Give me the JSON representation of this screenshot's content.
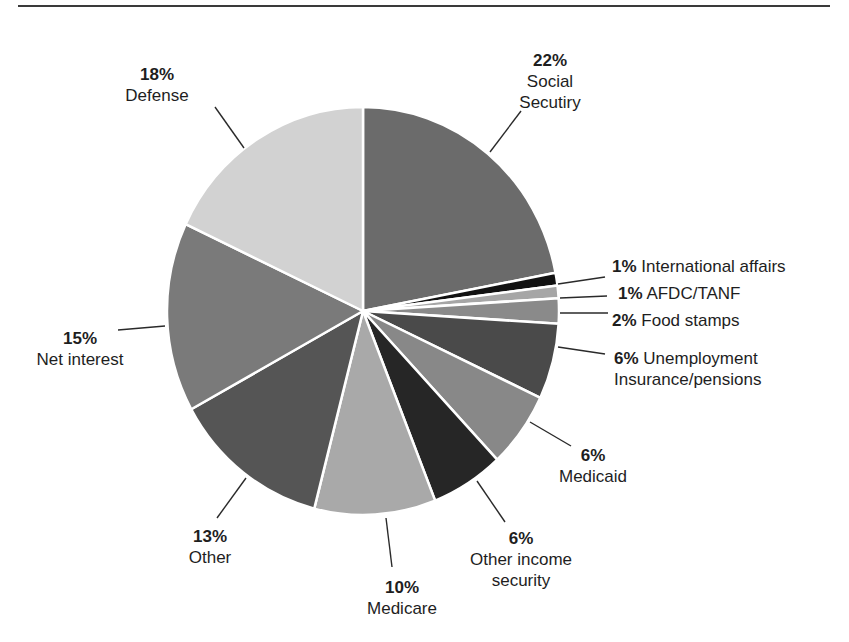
{
  "chart_data": {
    "type": "pie",
    "title": "",
    "start_angle": "12 o'clock",
    "direction": "clockwise",
    "slices": [
      {
        "label": "Social Secutiry",
        "value": 22,
        "pct_label": "22%",
        "color": "#6b6b6b"
      },
      {
        "label": "International affairs",
        "value": 1,
        "pct_label": "1%",
        "color": "#111111"
      },
      {
        "label": "AFDC/TANF",
        "value": 1,
        "pct_label": "1%",
        "color": "#a6a6a6"
      },
      {
        "label": "Food stamps",
        "value": 2,
        "pct_label": "2%",
        "color": "#8a8a8a"
      },
      {
        "label": "Unemployment Insurance/pensions",
        "value": 6,
        "pct_label": "6%",
        "color": "#4a4a4a"
      },
      {
        "label": "Medicaid",
        "value": 6,
        "pct_label": "6%",
        "color": "#888888"
      },
      {
        "label": "Other income security",
        "value": 6,
        "pct_label": "6%",
        "color": "#262626"
      },
      {
        "label": "Medicare",
        "value": 10,
        "pct_label": "10%",
        "color": "#a9a9a9"
      },
      {
        "label": "Other",
        "value": 13,
        "pct_label": "13%",
        "color": "#555555"
      },
      {
        "label": "Net interest",
        "value": 15,
        "pct_label": "15%",
        "color": "#7a7a7a"
      },
      {
        "label": "Defense",
        "value": 18,
        "pct_label": "18%",
        "color": "#d2d2d2"
      }
    ],
    "legend": "none (direct labels with leader lines)"
  },
  "labels": {
    "social_security": {
      "pct": "22%",
      "line1": "Social",
      "line2": "Secutiry"
    },
    "intl_affairs": {
      "pct": "1%",
      "text": "International affairs"
    },
    "afdc": {
      "pct": "1%",
      "text": "AFDC/TANF"
    },
    "food_stamps": {
      "pct": "2%",
      "text": "Food stamps"
    },
    "unemployment": {
      "pct": "6%",
      "line1": "Unemployment",
      "line2": "Insurance/pensions"
    },
    "medicaid": {
      "pct": "6%",
      "text": "Medicaid"
    },
    "other_income": {
      "pct": "6%",
      "line1": "Other income",
      "line2": "security"
    },
    "medicare": {
      "pct": "10%",
      "text": "Medicare"
    },
    "other": {
      "pct": "13%",
      "text": "Other"
    },
    "net_interest": {
      "pct": "15%",
      "text": "Net interest"
    },
    "defense": {
      "pct": "18%",
      "text": "Defense"
    }
  }
}
